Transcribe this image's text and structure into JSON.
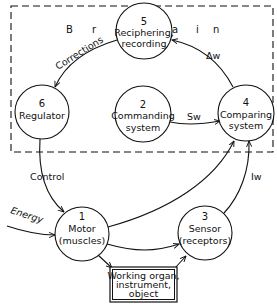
{
  "region": {
    "label_letters": [
      "B",
      "r",
      "a",
      "i",
      "n"
    ],
    "label": "Brain",
    "style": "dashed"
  },
  "nodes": {
    "n1": {
      "number": "1",
      "line1": "Motor",
      "line2": "(muscles)"
    },
    "n2": {
      "number": "2",
      "line1": "Commanding",
      "line2": "system"
    },
    "n3": {
      "number": "3",
      "line1": "Sensor",
      "line2": "(receptors)"
    },
    "n4": {
      "number": "4",
      "line1": "Comparing",
      "line2": "system"
    },
    "n5": {
      "number": "5",
      "line1": "Reciphering,",
      "line2": "recording"
    },
    "n6": {
      "number": "6",
      "line1": "Regulator",
      "line2": ""
    },
    "organ": {
      "line1": "Working organ,",
      "line2": "instrument,",
      "line3": "object"
    }
  },
  "edges": {
    "corrections": "Corrections",
    "delta_w": "Δw",
    "sw": "Sw",
    "control": "Control",
    "energy": "Energy",
    "iw": "Iw"
  },
  "colors": {
    "line": "#111111",
    "background": "#ffffff"
  }
}
